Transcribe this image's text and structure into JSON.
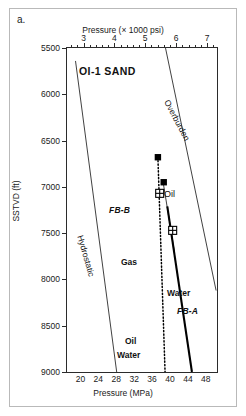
{
  "figure": {
    "panel_letter": "a.",
    "top_axis_title": "Pressure (× 1000 psi)",
    "bottom_axis_title": "Pressure (MPa)",
    "y_axis_title": "SSTVD (ft)",
    "sand_label": "OI-1 SAND"
  },
  "annotations": {
    "overburden": "Overburden",
    "hydrostatic": "Hydrostatic",
    "oil": "Oil",
    "gas": "Gas",
    "water": "Water",
    "oil_bottom": "Oil",
    "water_bottom": "Water",
    "fb_b": "FB-B",
    "fb_a": "FB-A"
  },
  "colors": {
    "axis": "#2b2b2b",
    "text": "#111111",
    "line_thin": "#2b2b2b",
    "line_thick": "#000000",
    "marker_filled": "#000000",
    "marker_open_fill": "#ffffff",
    "frame": "#b9b9b9"
  },
  "chart_data": {
    "type": "scatter",
    "title": "OI-1 SAND",
    "xlabel": "Pressure (MPa)",
    "xlabel_secondary": "Pressure (× 1000 psi)",
    "ylabel": "SSTVD (ft)",
    "xlim": [
      17.0,
      50.5
    ],
    "ylim": [
      5500,
      9000
    ],
    "y_inverted": true,
    "grid": false,
    "legend": "none",
    "x_ticks_mpa": [
      20,
      24,
      28,
      32,
      36,
      40,
      44,
      48
    ],
    "x_ticks_psi_thousands": [
      3,
      4,
      5,
      6,
      7
    ],
    "y_ticks": [
      5500,
      6000,
      6500,
      7000,
      7500,
      8000,
      8500,
      9000
    ],
    "series": [
      {
        "name": "Hydrostatic",
        "type": "line",
        "style": "thin-solid",
        "points": [
          [
            18.9,
            5640
          ],
          [
            28.1,
            9000
          ]
        ]
      },
      {
        "name": "Overburden",
        "type": "line",
        "style": "thin-solid",
        "points": [
          [
            39.0,
            5500
          ],
          [
            50.3,
            8120
          ]
        ]
      },
      {
        "name": "Gas",
        "type": "line",
        "style": "dotted",
        "points": [
          [
            37.3,
            6680
          ],
          [
            38.9,
            9000
          ]
        ]
      },
      {
        "name": "Oil",
        "type": "line",
        "style": "thin-solid",
        "points": [
          [
            38.5,
            6960
          ],
          [
            41.0,
            7700
          ]
        ]
      },
      {
        "name": "Water",
        "type": "line",
        "style": "thick-solid",
        "points": [
          [
            39.4,
            7210
          ],
          [
            44.9,
            9000
          ]
        ]
      },
      {
        "name": "FB-A",
        "type": "line",
        "style": "thick-solid",
        "points": [
          [
            39.4,
            7210
          ],
          [
            44.9,
            9000
          ]
        ]
      },
      {
        "name": "FB-B",
        "type": "line",
        "style": "dotted",
        "points": [
          [
            37.3,
            6680
          ],
          [
            38.9,
            9000
          ]
        ]
      }
    ],
    "markers": [
      {
        "label": "",
        "style": "filled-square",
        "x": 37.3,
        "y": 6680
      },
      {
        "label": "",
        "style": "filled-square",
        "x": 38.6,
        "y": 6950
      },
      {
        "label": "",
        "style": "open-square-cross",
        "x": 37.7,
        "y": 7070
      },
      {
        "label": "",
        "style": "open-square-cross",
        "x": 40.6,
        "y": 7470
      }
    ]
  }
}
